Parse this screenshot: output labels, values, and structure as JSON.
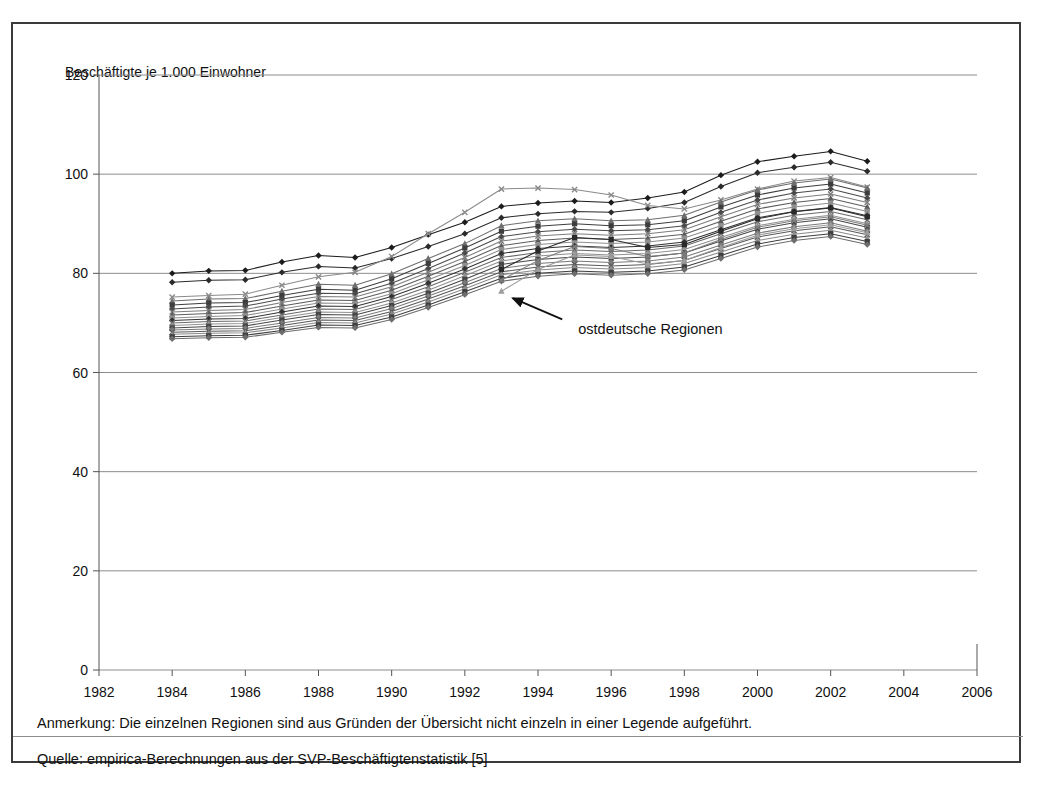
{
  "figure": {
    "y_axis_title": "Beschäftigte je 1.000 Einwohner",
    "annotation": "ostdeutsche Regionen",
    "note": "Anmerkung: Die einzelnen Regionen sind aus Gründen der Übersicht nicht einzeln in einer Legende aufgeführt.",
    "source": "Quelle: empirica-Berechnungen aus der SVP-Beschäftigtenstatistik [5]",
    "frame_color": "#3a3a3a",
    "grid_color": "#8d8d8d"
  },
  "chart_data": {
    "type": "line",
    "title": "",
    "subtitle": "",
    "xlabel": "",
    "ylabel": "Beschäftigte je 1.000 Einwohner",
    "xlim": [
      1982,
      2006
    ],
    "ylim": [
      0,
      120
    ],
    "xticks": [
      1982,
      1984,
      1986,
      1988,
      1990,
      1992,
      1994,
      1996,
      1998,
      2000,
      2002,
      2004,
      2006
    ],
    "yticks": [
      0,
      20,
      40,
      60,
      80,
      100,
      120
    ],
    "grid": "horizontal",
    "legend": "none",
    "annotations": [
      {
        "text": "ostdeutsche Regionen",
        "x": 1995.1,
        "y": 68.5,
        "arrow_to_x": 1993.2,
        "arrow_to_y": 76.0
      }
    ],
    "x": [
      1984,
      1985,
      1986,
      1987,
      1988,
      1989,
      1990,
      1991,
      1992,
      1993,
      1994,
      1995,
      1996,
      1997,
      1998,
      1999,
      2000,
      2001,
      2002,
      2003
    ],
    "series": [
      {
        "name": "Region 01",
        "group": "west",
        "marker": "diamond",
        "color": "#1c1c1c",
        "values": [
          80.0,
          80.5,
          80.6,
          82.3,
          83.6,
          83.2,
          85.2,
          87.8,
          90.3,
          93.5,
          94.2,
          94.6,
          94.3,
          95.2,
          96.4,
          99.8,
          102.5,
          103.6,
          104.6,
          102.6
        ]
      },
      {
        "name": "Region 02",
        "group": "west",
        "marker": "diamond",
        "color": "#2b2b2b",
        "values": [
          78.2,
          78.6,
          78.7,
          80.2,
          81.4,
          81.1,
          83.0,
          85.4,
          88.0,
          91.2,
          92.0,
          92.5,
          92.3,
          93.1,
          94.3,
          97.5,
          100.3,
          101.4,
          102.4,
          100.6
        ]
      },
      {
        "name": "Region 03",
        "group": "west",
        "marker": "cross",
        "color": "#8a8a8a",
        "values": [
          75.2,
          75.5,
          75.8,
          77.6,
          79.3,
          80.2,
          83.4,
          88.0,
          92.3,
          97.0,
          97.2,
          96.9,
          95.8,
          93.7,
          93.0,
          94.8,
          97.0,
          98.6,
          99.3,
          97.4
        ]
      },
      {
        "name": "Region 04",
        "group": "west",
        "marker": "triangle",
        "color": "#6e6e6e",
        "values": [
          74.4,
          74.8,
          74.9,
          76.4,
          77.8,
          77.6,
          79.9,
          83.0,
          86.0,
          89.6,
          90.6,
          91.0,
          90.6,
          90.8,
          91.7,
          94.4,
          96.8,
          98.2,
          99.0,
          97.2
        ]
      },
      {
        "name": "Region 05",
        "group": "west",
        "marker": "square",
        "color": "#3d3d3d",
        "values": [
          73.6,
          74.0,
          74.1,
          75.5,
          76.8,
          76.6,
          78.9,
          82.0,
          85.1,
          88.5,
          89.5,
          90.0,
          89.6,
          89.8,
          90.6,
          93.4,
          95.8,
          97.2,
          98.0,
          96.2
        ]
      },
      {
        "name": "Region 06",
        "group": "west",
        "marker": "diamond",
        "color": "#4a4a4a",
        "values": [
          72.8,
          73.2,
          73.4,
          74.8,
          76.0,
          75.9,
          78.0,
          81.0,
          84.1,
          87.4,
          88.4,
          88.9,
          88.6,
          88.8,
          89.6,
          92.3,
          94.8,
          96.2,
          97.0,
          95.2
        ]
      },
      {
        "name": "Region 07",
        "group": "west",
        "marker": "cross",
        "color": "#7d7d7d",
        "values": [
          72.2,
          72.5,
          72.7,
          74.1,
          75.3,
          75.2,
          77.3,
          80.2,
          83.2,
          86.5,
          87.5,
          88.0,
          87.7,
          88.0,
          88.8,
          91.4,
          93.9,
          95.2,
          96.0,
          94.3
        ]
      },
      {
        "name": "Region 08",
        "group": "west",
        "marker": "triangle",
        "color": "#5c5c5c",
        "values": [
          71.6,
          71.9,
          72.1,
          73.4,
          74.6,
          74.5,
          76.6,
          79.4,
          82.4,
          85.6,
          86.6,
          87.1,
          86.8,
          87.1,
          87.9,
          90.5,
          93.0,
          94.3,
          95.1,
          93.4
        ]
      },
      {
        "name": "Region 09",
        "group": "west",
        "marker": "square",
        "color": "#8f8f8f",
        "values": [
          71.0,
          71.3,
          71.5,
          72.8,
          74.0,
          73.9,
          75.9,
          78.7,
          81.6,
          84.8,
          85.8,
          86.3,
          86.0,
          86.3,
          87.1,
          89.6,
          92.1,
          93.4,
          94.2,
          92.5
        ]
      },
      {
        "name": "Region 10",
        "group": "west",
        "marker": "diamond",
        "color": "#333333",
        "values": [
          70.5,
          70.8,
          70.9,
          72.2,
          73.4,
          73.3,
          75.3,
          78.0,
          80.9,
          84.0,
          85.0,
          85.5,
          85.2,
          85.5,
          86.3,
          88.8,
          91.2,
          92.5,
          93.3,
          91.6
        ]
      },
      {
        "name": "Region 11",
        "group": "west",
        "marker": "cross",
        "color": "#6a6a6a",
        "values": [
          70.0,
          70.3,
          70.4,
          71.6,
          72.8,
          72.7,
          74.7,
          77.3,
          80.2,
          83.2,
          84.2,
          84.7,
          84.4,
          84.7,
          85.5,
          88.0,
          90.4,
          91.7,
          92.5,
          90.8
        ]
      },
      {
        "name": "Region 12",
        "group": "west",
        "marker": "triangle",
        "color": "#909090",
        "values": [
          69.5,
          69.8,
          69.9,
          71.1,
          72.2,
          72.1,
          74.0,
          76.6,
          79.5,
          82.5,
          83.5,
          84.0,
          83.7,
          84.0,
          84.8,
          87.2,
          89.6,
          90.9,
          91.7,
          90.0
        ]
      },
      {
        "name": "Region 13",
        "group": "west",
        "marker": "square",
        "color": "#474747",
        "values": [
          69.0,
          69.3,
          69.4,
          70.6,
          71.7,
          71.6,
          73.5,
          76.0,
          78.8,
          81.8,
          82.8,
          83.3,
          83.0,
          83.3,
          84.1,
          86.5,
          88.9,
          90.2,
          91.0,
          89.3
        ]
      },
      {
        "name": "Region 14",
        "group": "west",
        "marker": "diamond",
        "color": "#7a7a7a",
        "values": [
          68.6,
          68.8,
          68.9,
          70.0,
          71.1,
          71.0,
          72.9,
          75.4,
          78.1,
          81.0,
          82.0,
          82.5,
          82.2,
          82.5,
          83.3,
          85.7,
          88.1,
          89.4,
          90.2,
          88.5
        ]
      },
      {
        "name": "Region 15",
        "group": "west",
        "marker": "cross",
        "color": "#595959",
        "values": [
          68.1,
          68.3,
          68.4,
          69.5,
          70.6,
          70.5,
          72.3,
          74.8,
          77.5,
          80.3,
          81.3,
          81.8,
          81.5,
          81.8,
          82.6,
          85.0,
          87.3,
          88.6,
          89.4,
          87.8
        ]
      },
      {
        "name": "Region 16",
        "group": "west",
        "marker": "triangle",
        "color": "#8b8b8b",
        "values": [
          67.7,
          67.9,
          68.0,
          69.0,
          70.1,
          70.0,
          71.8,
          74.2,
          76.9,
          79.7,
          80.7,
          81.2,
          80.9,
          81.2,
          82.0,
          84.3,
          86.6,
          87.9,
          88.7,
          87.1
        ]
      },
      {
        "name": "Region 17",
        "group": "west",
        "marker": "square",
        "color": "#3f3f3f",
        "values": [
          67.2,
          67.4,
          67.5,
          68.5,
          69.6,
          69.5,
          71.2,
          73.6,
          76.3,
          79.0,
          80.0,
          80.5,
          80.2,
          80.5,
          81.3,
          83.6,
          85.9,
          87.2,
          88.0,
          86.4
        ]
      },
      {
        "name": "Region 18",
        "group": "west",
        "marker": "diamond",
        "color": "#6d6d6d",
        "values": [
          66.8,
          67.0,
          67.1,
          68.1,
          69.1,
          69.0,
          70.7,
          73.1,
          75.7,
          78.4,
          79.4,
          79.9,
          79.6,
          79.9,
          80.7,
          83.0,
          85.3,
          86.6,
          87.4,
          85.8
        ]
      },
      {
        "name": "Ost 01",
        "group": "ost",
        "marker": "square",
        "color": "#2a2a2a",
        "values": [
          null,
          null,
          null,
          null,
          null,
          null,
          null,
          null,
          null,
          80.8,
          84.5,
          87.2,
          86.8,
          85.2,
          85.8,
          88.5,
          91.0,
          92.4,
          93.2,
          91.4
        ]
      },
      {
        "name": "Ost 02",
        "group": "ost",
        "marker": "cross",
        "color": "#7f7f7f",
        "values": [
          null,
          null,
          null,
          null,
          null,
          null,
          null,
          null,
          null,
          78.6,
          82.6,
          85.4,
          85.0,
          83.4,
          84.1,
          86.8,
          89.3,
          90.6,
          91.4,
          89.7
        ]
      },
      {
        "name": "Ost 03",
        "group": "ost",
        "marker": "triangle",
        "color": "#9b9b9b",
        "values": [
          null,
          null,
          null,
          null,
          null,
          null,
          null,
          null,
          null,
          76.4,
          80.8,
          83.7,
          83.4,
          81.9,
          82.6,
          85.2,
          87.7,
          89.0,
          89.8,
          88.2
        ]
      }
    ]
  }
}
